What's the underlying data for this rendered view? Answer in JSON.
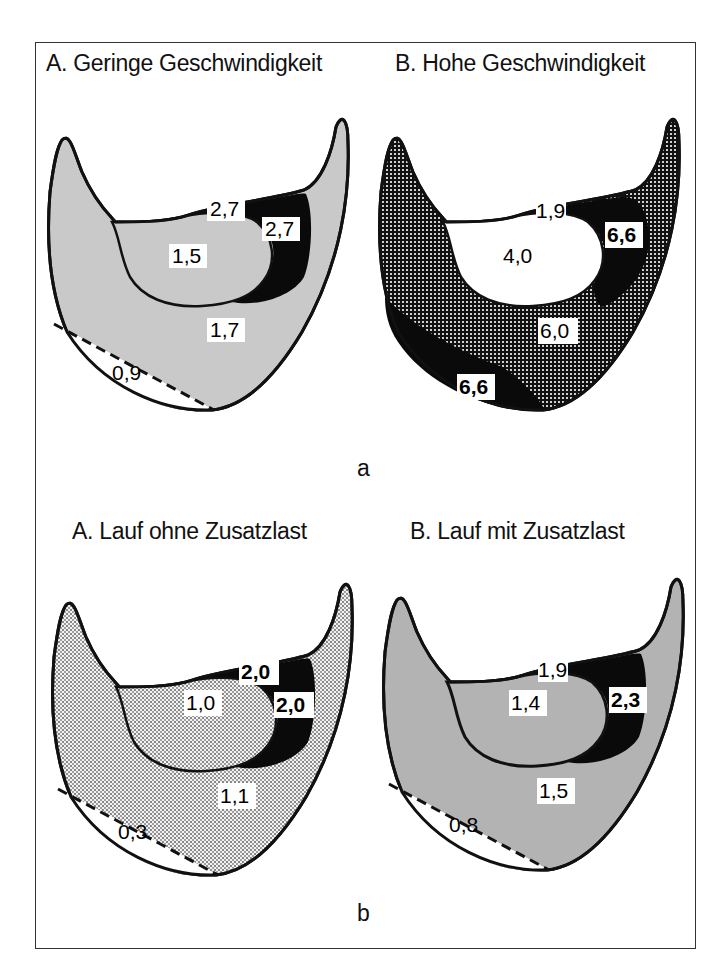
{
  "figure_a": {
    "caption": "a",
    "panel_A": {
      "title": "A. Geringe Geschwindigkeit",
      "regions": {
        "toe_top": "2,7",
        "toe_side": "2,7",
        "inner": "1,5",
        "outer": "1,7",
        "edge": "0,9"
      }
    },
    "panel_B": {
      "title": "B. Hohe Geschwindigkeit",
      "regions": {
        "toe_top": "1,9",
        "toe_side": "6,6",
        "inner": "4,0",
        "outer": "6,0",
        "edge": "6,6"
      }
    }
  },
  "figure_b": {
    "caption": "b",
    "panel_A": {
      "title": "A. Lauf ohne Zusatzlast",
      "regions": {
        "toe_top": "2,0",
        "toe_side": "2,0",
        "inner": "1,0",
        "outer": "1,1",
        "edge": "0,3"
      }
    },
    "panel_B": {
      "title": "B. Lauf mit Zusatzlast",
      "regions": {
        "toe_top": "1,9",
        "toe_side": "2,3",
        "inner": "1,4",
        "outer": "1,5",
        "edge": "0,8"
      }
    }
  },
  "colors": {
    "light_gray": "#c9c9c9",
    "mid_gray": "#b3b3b3",
    "dark": "#0a0a0a",
    "white": "#ffffff"
  }
}
